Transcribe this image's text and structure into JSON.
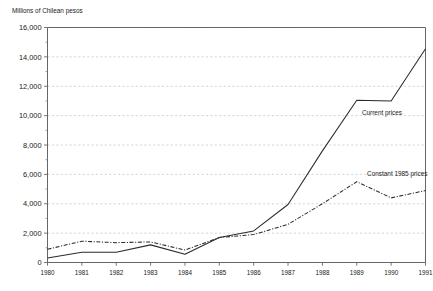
{
  "chart_data": {
    "type": "line",
    "title": "",
    "subtitle": "",
    "ylabel": "Millions of Chilean pesos",
    "xlabel": "",
    "ylim": [
      0,
      16000
    ],
    "xlim": [
      1980,
      1991
    ],
    "grid": "horizontal-dashed",
    "legend_position": "inline-annotations",
    "x": [
      1980,
      1981,
      1982,
      1983,
      1984,
      1985,
      1986,
      1987,
      1988,
      1989,
      1990,
      1991
    ],
    "categories": [
      "1980",
      "1981",
      "1982",
      "1983",
      "1984",
      "1985",
      "1986",
      "1987",
      "1988",
      "1989",
      "1990",
      "1991"
    ],
    "ytick_values": [
      0,
      2000,
      4000,
      6000,
      8000,
      10000,
      12000,
      14000,
      16000
    ],
    "ytick_labels": [
      "0",
      "2,000",
      "4,000",
      "6,000",
      "8,000",
      "10,000",
      "12,000",
      "14,000",
      "16,000"
    ],
    "yminor_values": [
      1000,
      3000,
      5000,
      7000,
      9000,
      11000,
      13000,
      15000
    ],
    "series": [
      {
        "name": "Current prices",
        "style": "solid",
        "label_x": 1989.15,
        "label_y": 10050,
        "values": [
          300,
          700,
          700,
          1200,
          560,
          1700,
          2150,
          3950,
          7600,
          11050,
          11000,
          14550
        ]
      },
      {
        "name": "Constant 1985 prices",
        "style": "dash-dot",
        "label_x": 1989.3,
        "label_y": 5900,
        "values": [
          900,
          1450,
          1350,
          1400,
          850,
          1700,
          1900,
          2600,
          4000,
          5500,
          4400,
          4900
        ]
      }
    ]
  }
}
